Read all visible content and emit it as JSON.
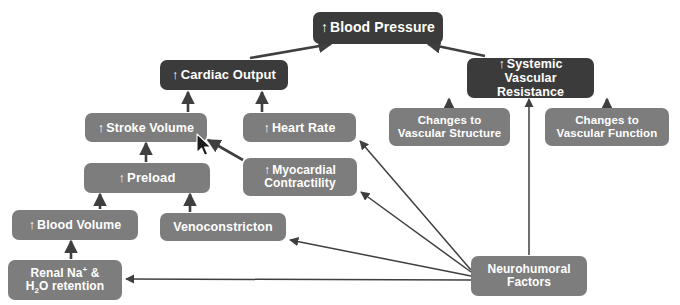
{
  "diagram": {
    "canvas": {
      "width": 680,
      "height": 305,
      "background": "#ffffff"
    },
    "colors": {
      "dark_node": "#3b3b3b",
      "light_node": "#7d7d7d",
      "node_text": "#ffffff",
      "edge": "#3f3f3f"
    },
    "arrow_glyph": "↑",
    "nodes": [
      {
        "id": "blood-pressure",
        "label": "Blood Pressure",
        "arrow": "↑",
        "style": "dark",
        "x": 313,
        "y": 12,
        "w": 130,
        "h": 32,
        "font_size": 14
      },
      {
        "id": "cardiac-output",
        "label": "Cardiac Output",
        "arrow": "↑",
        "style": "dark",
        "x": 160,
        "y": 60,
        "w": 128,
        "h": 30,
        "font_size": 13
      },
      {
        "id": "systemic-vascular-resistance",
        "label": "Systemic Vascular Resistance",
        "arrow": "↑",
        "style": "dark",
        "x": 467,
        "y": 58,
        "w": 127,
        "h": 40,
        "font_size": 12.5
      },
      {
        "id": "stroke-volume",
        "label": "Stroke Volume",
        "arrow": "↑",
        "style": "light",
        "x": 85,
        "y": 113,
        "w": 122,
        "h": 29,
        "font_size": 12.5
      },
      {
        "id": "heart-rate",
        "label": "Heart Rate",
        "arrow": "↑",
        "style": "light",
        "x": 243,
        "y": 113,
        "w": 113,
        "h": 29,
        "font_size": 12.5
      },
      {
        "id": "changes-to-vascular-structure",
        "label": "Changes to Vascular Structure",
        "arrow": "",
        "style": "light",
        "x": 389,
        "y": 108,
        "w": 121,
        "h": 38,
        "font_size": 11.5
      },
      {
        "id": "changes-to-vascular-function",
        "label": "Changes to Vascular Function",
        "arrow": "",
        "style": "light",
        "x": 545,
        "y": 108,
        "w": 124,
        "h": 38,
        "font_size": 11.5
      },
      {
        "id": "preload",
        "label": "Preload",
        "arrow": "↑",
        "style": "light",
        "x": 84,
        "y": 163,
        "w": 126,
        "h": 30,
        "font_size": 13
      },
      {
        "id": "myocardial-contractility",
        "label": "Myocardial Contractility",
        "arrow": "↑",
        "style": "light",
        "x": 243,
        "y": 158,
        "w": 114,
        "h": 38,
        "font_size": 12
      },
      {
        "id": "blood-volume",
        "label": "Blood Volume",
        "arrow": "↑",
        "style": "light",
        "x": 12,
        "y": 210,
        "w": 126,
        "h": 30,
        "font_size": 12.5
      },
      {
        "id": "venoconstricton",
        "label": "Venoconstricton",
        "arrow": "",
        "style": "light",
        "x": 160,
        "y": 213,
        "w": 126,
        "h": 28,
        "font_size": 12.5
      },
      {
        "id": "renal-na-h2o-retention",
        "label": "Renal Na+ & H2O retention",
        "label_html": "Renal Na<sup>+</sup> &amp;<br>H<sub>2</sub>O retention",
        "arrow": "",
        "style": "light",
        "x": 8,
        "y": 260,
        "w": 114,
        "h": 40,
        "font_size": 12
      },
      {
        "id": "neurohumoral-factors",
        "label": "Neurohumoral Factors",
        "arrow": "",
        "style": "light",
        "x": 471,
        "y": 256,
        "w": 116,
        "h": 40,
        "font_size": 12
      }
    ],
    "edges": [
      {
        "id": "edge-cardiac-output-to-blood-pressure",
        "from": "cardiac-output",
        "to": "blood-pressure",
        "path": "M 250 58 L 331 44"
      },
      {
        "id": "edge-svr-to-blood-pressure",
        "from": "systemic-vascular-resistance",
        "to": "blood-pressure",
        "path": "M 485 56 L 428 44"
      },
      {
        "id": "edge-stroke-volume-to-cardiac-output",
        "from": "stroke-volume",
        "to": "cardiac-output",
        "path": "M 188 112 L 188 92"
      },
      {
        "id": "edge-heart-rate-to-cardiac-output",
        "from": "heart-rate",
        "to": "cardiac-output",
        "path": "M 262 112 L 262 92"
      },
      {
        "id": "edge-preload-to-stroke-volume",
        "from": "preload",
        "to": "stroke-volume",
        "path": "M 146 162 L 146 143"
      },
      {
        "id": "edge-blood-volume-to-preload",
        "from": "blood-volume",
        "to": "preload",
        "path": "M 100 209 L 100 194"
      },
      {
        "id": "edge-venoconstricton-to-preload",
        "from": "venoconstricton",
        "to": "preload",
        "path": "M 190 212 L 190 194"
      },
      {
        "id": "edge-renal-to-blood-volume",
        "from": "renal-na-h2o-retention",
        "to": "blood-volume",
        "path": "M 71 259 L 71 241"
      },
      {
        "id": "edge-myocardial-to-stroke-volume",
        "from": "myocardial-contractility",
        "to": "stroke-volume",
        "path": "M 243 160 L 208 140"
      },
      {
        "id": "edge-cvstructure-to-svr",
        "from": "changes-to-vascular-structure",
        "to": "systemic-vascular-resistance",
        "path": "M 449 107 L 449 99"
      },
      {
        "id": "edge-cvfunction-to-svr",
        "from": "changes-to-vascular-function",
        "to": "systemic-vascular-resistance",
        "path": "M 607 107 L 607 99"
      },
      {
        "id": "edge-neurohumoral-to-svr",
        "from": "neurohumoral-factors",
        "to": "systemic-vascular-resistance",
        "path": "M 529 255 L 529 99"
      },
      {
        "id": "edge-neurohumoral-to-heart-rate",
        "from": "neurohumoral-factors",
        "to": "heart-rate",
        "path": "M 471 270 L 360 141"
      },
      {
        "id": "edge-neurohumoral-to-myocardial",
        "from": "neurohumoral-factors",
        "to": "myocardial-contractility",
        "path": "M 471 272 L 361 192"
      },
      {
        "id": "edge-neurohumoral-to-venoconstricton",
        "from": "neurohumoral-factors",
        "to": "venoconstricton",
        "path": "M 471 276 L 290 240"
      },
      {
        "id": "edge-neurohumoral-to-renal",
        "from": "neurohumoral-factors",
        "to": "renal-na-h2o-retention",
        "path": "M 471 280 L 126 279"
      }
    ],
    "cursor": {
      "id": "mouse-pointer",
      "x": 196,
      "y": 133
    }
  }
}
